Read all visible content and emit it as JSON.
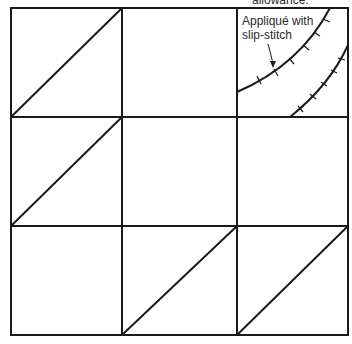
{
  "diagram": {
    "type": "quilt-block-diagram",
    "grid": {
      "rows": 3,
      "cols": 3
    },
    "top_label_partial": "allowance.",
    "callout_label_line1": "Appliqué with",
    "callout_label_line2": "slip-stitch",
    "cells": [
      {
        "row": 0,
        "col": 0,
        "content": "diagonal bottom-left to top-right"
      },
      {
        "row": 0,
        "col": 1,
        "content": "plain"
      },
      {
        "row": 0,
        "col": 2,
        "content": "curved appliqué strip with slip-stitch"
      },
      {
        "row": 1,
        "col": 0,
        "content": "diagonal bottom-left to top-right"
      },
      {
        "row": 1,
        "col": 1,
        "content": "plain"
      },
      {
        "row": 1,
        "col": 2,
        "content": "plain"
      },
      {
        "row": 2,
        "col": 0,
        "content": "plain"
      },
      {
        "row": 2,
        "col": 1,
        "content": "diagonal bottom-left to top-right"
      },
      {
        "row": 2,
        "col": 2,
        "content": "diagonal bottom-left to top-right"
      }
    ],
    "line_color": "#1a1a1a"
  }
}
